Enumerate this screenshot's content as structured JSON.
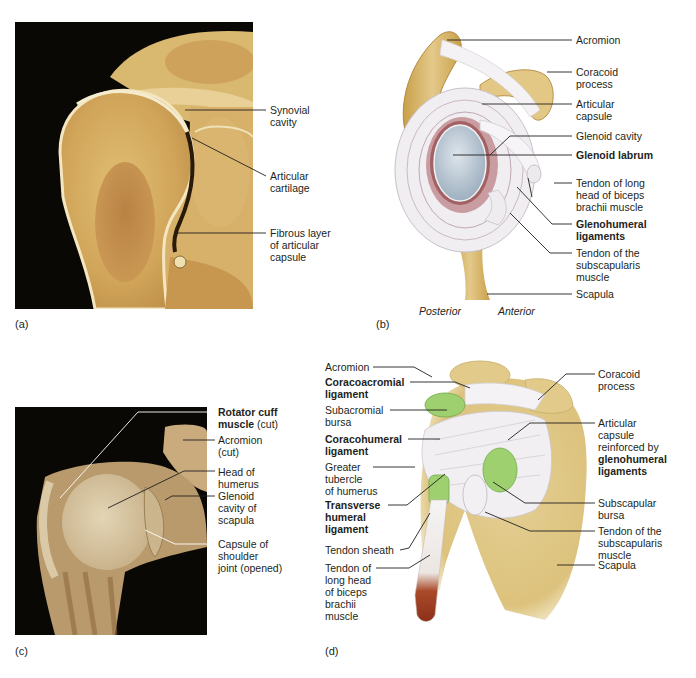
{
  "figure": {
    "colors": {
      "background": "#ffffff",
      "photo_black": "#0a0805",
      "bone_tan": "#d8b56a",
      "bone_dark": "#b07a35",
      "ligament_white": "#eeeaf0",
      "bursa_green": "#8fc66a",
      "glenoid_blue": "#b9c6d2",
      "labrum_red": "#8a3a3a",
      "muscle_red": "#9e3a1c",
      "label_text": "#231f20"
    },
    "panels": {
      "a": {
        "tag": "(a)",
        "labels": [
          {
            "text": "Synovial\ncavity",
            "bold": false
          },
          {
            "text": "Articular\ncartilage",
            "bold": false
          },
          {
            "text": "Fibrous layer\nof articular\ncapsule",
            "bold": false
          }
        ]
      },
      "b": {
        "tag": "(b)",
        "orientation": {
          "left": "Posterior",
          "right": "Anterior"
        },
        "labels": [
          {
            "text": "Acromion",
            "bold": false
          },
          {
            "text": "Coracoid\nprocess",
            "bold": false
          },
          {
            "text": "Articular\ncapsule",
            "bold": false
          },
          {
            "text": "Glenoid cavity",
            "bold": false
          },
          {
            "text": "Glenoid labrum",
            "bold": true
          },
          {
            "text": "Tendon of long\nhead of biceps\nbrachii muscle",
            "bold": false
          },
          {
            "text": "Glenohumeral\nligaments",
            "bold": true
          },
          {
            "text": "Tendon of the\nsubscapularis\nmuscle",
            "bold": false
          },
          {
            "text": "Scapula",
            "bold": false
          }
        ]
      },
      "c": {
        "tag": "(c)",
        "labels": [
          {
            "bold_part": "Rotator cuff\nmuscle",
            "normal_part": " (cut)"
          },
          {
            "text": "Acromion\n(cut)",
            "bold": false
          },
          {
            "text": "Head of\nhumerus",
            "bold": false
          },
          {
            "text": "Glenoid\ncavity of\nscapula",
            "bold": false
          },
          {
            "text": "Capsule of\nshoulder\njoint (opened)",
            "bold": false
          }
        ]
      },
      "d": {
        "tag": "(d)",
        "left_labels": [
          {
            "text": "Acromion",
            "bold": false
          },
          {
            "text": "Coracoacromial\nligament",
            "bold": true
          },
          {
            "text": "Subacromial\nbursa",
            "bold": false
          },
          {
            "text": "Coracohumeral\nligament",
            "bold": true
          },
          {
            "text": "Greater\ntubercle\nof humerus",
            "bold": false
          },
          {
            "text": "Transverse\nhumeral\nligament",
            "bold": true
          },
          {
            "text": "Tendon sheath",
            "bold": false
          },
          {
            "text": "Tendon of\nlong head\nof biceps\nbrachii\nmuscle",
            "bold": false
          }
        ],
        "right_labels": [
          {
            "text": "Coracoid\nprocess",
            "bold": false
          },
          {
            "normal_part": "Articular\ncapsule\nreinforced by\n",
            "bold_part": "glenohumeral\nligaments"
          },
          {
            "text": "Subscapular\nbursa",
            "bold": false
          },
          {
            "text": "Tendon of the\nsubscapularis\nmuscle",
            "bold": false
          },
          {
            "text": "Scapula",
            "bold": false
          }
        ]
      }
    }
  }
}
